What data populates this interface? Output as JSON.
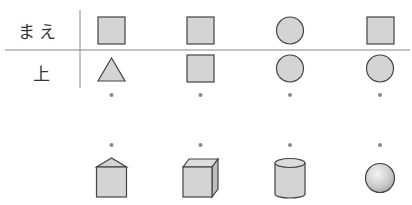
{
  "rows": {
    "front_label": "まえ",
    "top_label": "上"
  },
  "colors": {
    "fill": "#d4d4d4",
    "stroke": "#444444",
    "line": "#888888",
    "dot": "#888888"
  },
  "columns": [
    {
      "front_view": "square",
      "top_view": "triangle",
      "solid": "triangular-prism"
    },
    {
      "front_view": "square",
      "top_view": "square",
      "solid": "cube"
    },
    {
      "front_view": "circle",
      "top_view": "circle",
      "solid": "cylinder"
    },
    {
      "front_view": "square",
      "top_view": "circle",
      "solid": "sphere"
    }
  ]
}
